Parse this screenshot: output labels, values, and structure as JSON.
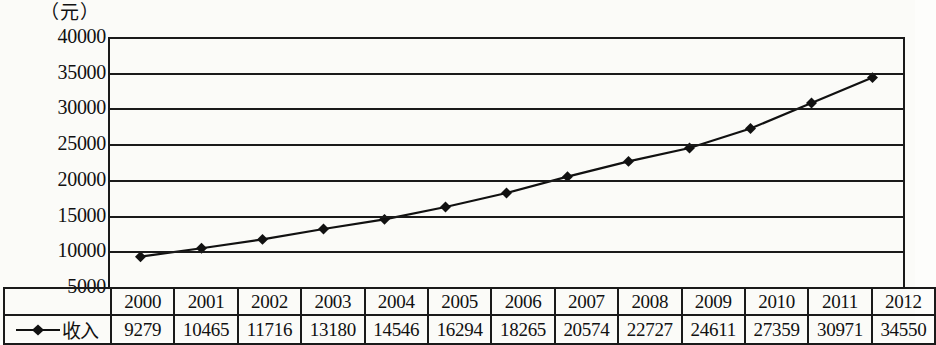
{
  "chart_data": {
    "type": "line",
    "title": "",
    "subtitle": "",
    "xlabel": "",
    "ylabel": "（元）",
    "unit_caption": "（元）",
    "categories": [
      "2000",
      "2001",
      "2002",
      "2003",
      "2004",
      "2005",
      "2006",
      "2007",
      "2008",
      "2009",
      "2010",
      "2011",
      "2012"
    ],
    "series": [
      {
        "name": "收入",
        "marker": "diamond",
        "color": "#111111",
        "values": [
          9279,
          10465,
          11716,
          13180,
          14546,
          16294,
          18265,
          20574,
          22727,
          24611,
          27359,
          30971,
          34550
        ]
      }
    ],
    "y_ticks": [
      40000,
      35000,
      30000,
      25000,
      20000,
      15000,
      10000,
      5000
    ],
    "ylim": [
      5000,
      40000
    ],
    "grid": "horizontal",
    "legend_position": "table-row-header",
    "annotations": []
  },
  "table": {
    "legend_label": "收入",
    "year_header": [
      "2000",
      "2001",
      "2002",
      "2003",
      "2004",
      "2005",
      "2006",
      "2007",
      "2008",
      "2009",
      "2010",
      "2011",
      "2012"
    ],
    "values": [
      "9279",
      "10465",
      "11716",
      "13180",
      "14546",
      "16294",
      "18265",
      "20574",
      "22727",
      "24611",
      "27359",
      "30971",
      "34550"
    ]
  },
  "colors": {
    "line": "#111111",
    "marker": "#111111",
    "grid": "#1a1a1a",
    "background": "#fbfbf8",
    "text": "#111111"
  }
}
